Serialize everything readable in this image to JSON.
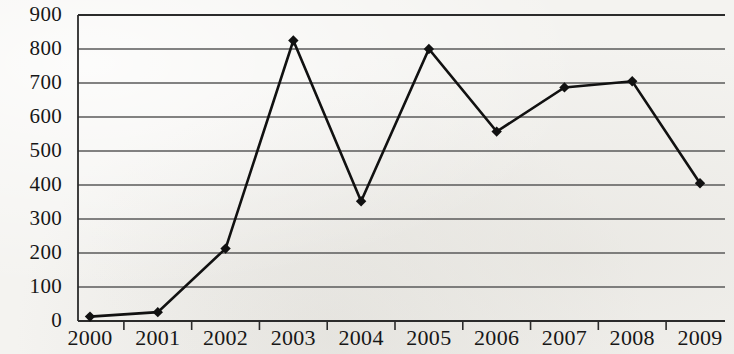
{
  "chart_data": {
    "type": "line",
    "title": "",
    "subtitle": "",
    "xlabel": "",
    "ylabel": "",
    "categories": [
      "2000",
      "2001",
      "2002",
      "2003",
      "2004",
      "2005",
      "2006",
      "2007",
      "2008",
      "2009"
    ],
    "values": [
      13,
      26,
      213,
      825,
      352,
      800,
      557,
      687,
      705,
      405
    ],
    "series": [
      {
        "name": "",
        "values": [
          13,
          26,
          213,
          825,
          352,
          800,
          557,
          687,
          705,
          405
        ]
      }
    ],
    "ylim": [
      0,
      900
    ],
    "yticks": [
      "0",
      "100",
      "200",
      "300",
      "400",
      "500",
      "600",
      "700",
      "800",
      "900"
    ],
    "ytick_values": [
      0,
      100,
      200,
      300,
      400,
      500,
      600,
      700,
      800,
      900
    ],
    "xticks": [
      "2000",
      "2001",
      "2002",
      "2003",
      "2004",
      "2005",
      "2006",
      "2007",
      "2008",
      "2009"
    ],
    "grid": true,
    "grid_axis": "y",
    "legend": false,
    "legend_position": "none",
    "marker": "diamond",
    "line_color": "#111111",
    "marker_color": "#111111",
    "grid_color": "#5a5a5a",
    "axis_color": "#2b2b2b",
    "background_color": "#f4f3f0",
    "annotations": []
  }
}
